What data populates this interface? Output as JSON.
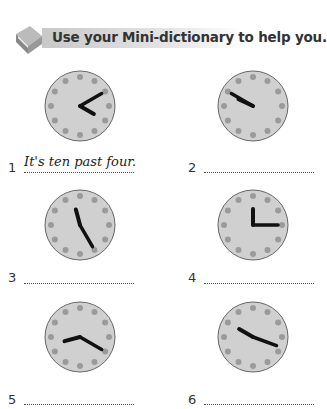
{
  "instruction": "Use your Mini-dictionary to help you.",
  "items": [
    {
      "number": "1",
      "answer": "It's ten past four.",
      "hour_angle": 120,
      "minute_angle": 60
    },
    {
      "number": "2",
      "answer": "",
      "hour_angle": 295,
      "minute_angle": 300
    },
    {
      "number": "3",
      "answer": "",
      "hour_angle": 345,
      "minute_angle": 150
    },
    {
      "number": "4",
      "answer": "",
      "hour_angle": 0,
      "minute_angle": 90
    },
    {
      "number": "5",
      "answer": "",
      "hour_angle": 255,
      "minute_angle": 120
    },
    {
      "number": "6",
      "answer": "",
      "hour_angle": 300,
      "minute_angle": 110
    }
  ],
  "colors": {
    "clock_face": "#d0d0d0",
    "dots": "#9a9a9a",
    "hands": "#111111",
    "rim": "#666666"
  }
}
